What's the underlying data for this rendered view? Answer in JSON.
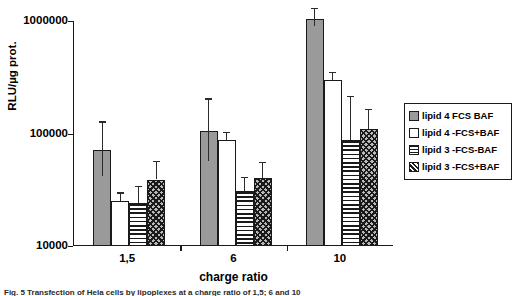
{
  "chart_data": {
    "type": "bar",
    "title": "",
    "xlabel": "charge ratio",
    "ylabel": "RLU/µg prot.",
    "yscale": "log",
    "ylim": [
      10000,
      1000000
    ],
    "yticks": [
      10000,
      100000,
      1000000
    ],
    "ytick_labels": [
      "10000",
      "100000",
      "1000000"
    ],
    "grid": false,
    "legend_position": "right",
    "categories": [
      "1,5",
      "6",
      "10"
    ],
    "series": [
      {
        "name": "lipid 4  FCS BAF",
        "pattern": "solid-gray",
        "values": [
          72000,
          105000,
          1050000
        ],
        "errors_upper": [
          128000,
          205000,
          1300000
        ],
        "errors_lower": [
          42000,
          57000,
          900000
        ]
      },
      {
        "name": "lipid 4 -FCS+BAF",
        "pattern": "empty-white",
        "values": [
          25000,
          88000,
          300000
        ],
        "errors_upper": [
          30000,
          104000,
          355000
        ],
        "errors_lower": [
          25000,
          88000,
          300000
        ]
      },
      {
        "name": "lipid 3 -FCS-BAF",
        "pattern": "horizontal-lines",
        "values": [
          24000,
          31000,
          88000
        ],
        "errors_upper": [
          34000,
          41000,
          215000
        ],
        "errors_lower": [
          24000,
          31000,
          88000
        ]
      },
      {
        "name": "lipid 3 -FCS+BAF",
        "pattern": "diagonal-hatch",
        "values": [
          39000,
          40000,
          110000
        ],
        "errors_upper": [
          57000,
          56000,
          165000
        ],
        "errors_lower": [
          39000,
          40000,
          110000
        ]
      }
    ]
  },
  "legend": {
    "entries": [
      {
        "label": "lipid 4  FCS BAF"
      },
      {
        "label": "lipid 4 -FCS+BAF"
      },
      {
        "label": "lipid 3 -FCS-BAF"
      },
      {
        "label": "lipid 3 -FCS+BAF"
      }
    ]
  },
  "caption": {
    "text": "Fig. 5 Transfection of Hela cells by lipoplexes at a charge ratio of 1,5; 6 and 10"
  }
}
